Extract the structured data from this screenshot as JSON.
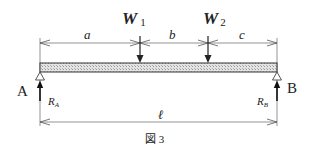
{
  "figure": {
    "caption": "図 3",
    "type": "simply supported beam with two point loads"
  },
  "loads": [
    {
      "name": "W",
      "sub": "1",
      "x": 140
    },
    {
      "name": "W",
      "sub": "2",
      "x": 208
    }
  ],
  "dimensions": {
    "top": [
      {
        "label": "a",
        "x1": 40,
        "x2": 140
      },
      {
        "label": "b",
        "x1": 140,
        "x2": 208
      },
      {
        "label": "c",
        "x1": 208,
        "x2": 277
      }
    ],
    "bottom": {
      "label": "ℓ",
      "x1": 40,
      "x2": 277
    }
  },
  "supports": [
    {
      "name": "A",
      "reaction": "R",
      "reaction_sub": "A",
      "x": 40
    },
    {
      "name": "B",
      "reaction": "R",
      "reaction_sub": "B",
      "x": 277
    }
  ],
  "colors": {
    "line": "#444444",
    "beam_fill": "#cfcfcf",
    "text": "#222222"
  }
}
